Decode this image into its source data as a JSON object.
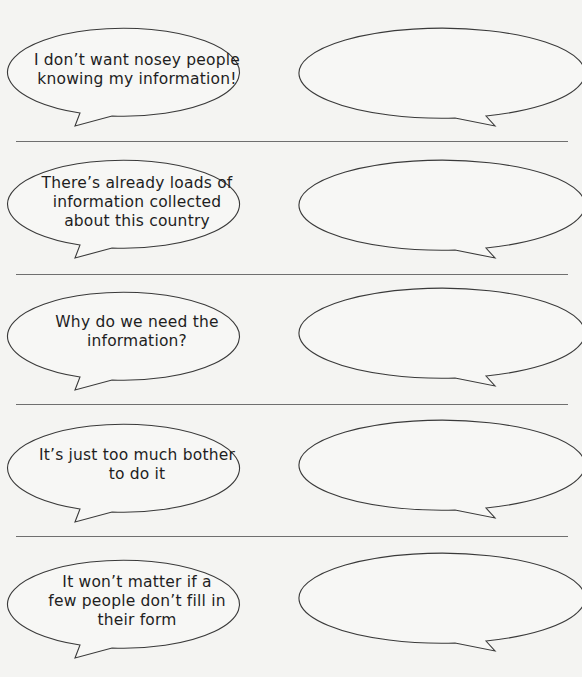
{
  "worksheet": {
    "rows": [
      {
        "statement": "I don’t want nosey people\nknowing my information!",
        "response": ""
      },
      {
        "statement": "There’s already loads of\ninformation collected\nabout this country",
        "response": ""
      },
      {
        "statement": "Why do we need the\ninformation?",
        "response": ""
      },
      {
        "statement": "It’s just too much bother\nto do it",
        "response": ""
      },
      {
        "statement": "It won’t matter if a\nfew people don’t fill in\ntheir form",
        "response": ""
      }
    ],
    "colors": {
      "background": "#f4f4f2",
      "bubble_fill": "#f7f7f5",
      "bubble_stroke": "#3a3a3a",
      "divider": "#6f6f6f",
      "text": "#1e1e1e"
    }
  }
}
